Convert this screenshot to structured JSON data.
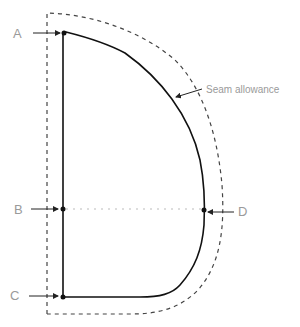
{
  "diagram": {
    "type": "sewing pattern piece",
    "points": [
      {
        "label": "A",
        "x": 64,
        "y": 33
      },
      {
        "label": "B",
        "x": 63,
        "y": 209
      },
      {
        "label": "C",
        "x": 63,
        "y": 297
      },
      {
        "label": "D",
        "x": 204,
        "y": 210
      }
    ],
    "annotations": {
      "seam_allowance": "Seam allowance"
    },
    "labels": {
      "a": "A",
      "b": "B",
      "c": "C",
      "d": "D"
    },
    "colors": {
      "pattern_line": "#111111",
      "seam_line": "#444444",
      "guide_line": "#bbbbbb",
      "label_text": "#9a9a9a"
    }
  }
}
